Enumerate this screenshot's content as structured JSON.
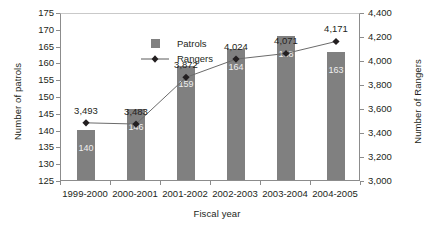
{
  "chart_data": {
    "type": "bar",
    "title": "",
    "xlabel": "Fiscal year",
    "ylabel": "Number of patrols",
    "ylabel_secondary": "Number of Rangers",
    "categories": [
      "1999-2000",
      "2000-2001",
      "2001-2002",
      "2002-2003",
      "2003-2004",
      "2004-2005"
    ],
    "ylim": [
      125,
      175
    ],
    "ylim_secondary": [
      3000,
      4400
    ],
    "yticks": [
      125,
      130,
      135,
      140,
      145,
      150,
      155,
      160,
      165,
      170,
      175
    ],
    "ytick_labels": [
      "125",
      "130",
      "135",
      "140",
      "145",
      "150",
      "155",
      "160",
      "165",
      "170",
      "175"
    ],
    "yticks_secondary": [
      3000,
      3200,
      3400,
      3600,
      3800,
      4000,
      4200,
      4400
    ],
    "ytick_labels_secondary": [
      "3,000",
      "3,200",
      "3,400",
      "3,600",
      "3,800",
      "4,000",
      "4,200",
      "4,400"
    ],
    "grid": false,
    "legend_position": "upper-left-inside",
    "series": [
      {
        "name": "Patrols",
        "type": "bar",
        "axis": "left",
        "color": "#808080",
        "values": [
          140,
          146,
          159,
          164,
          168,
          163
        ],
        "value_labels": [
          "140",
          "146",
          "159",
          "164",
          "168",
          "163"
        ]
      },
      {
        "name": "Rangers",
        "type": "line",
        "axis": "right",
        "color": "#231f20",
        "marker": "diamond",
        "values": [
          3493,
          3483,
          3872,
          4024,
          4071,
          4171
        ],
        "value_labels": [
          "3,493",
          "3,483",
          "3,872",
          "4,024",
          "4,071",
          "4,171"
        ]
      }
    ]
  },
  "legend": {
    "items": [
      {
        "label": "Patrols",
        "key": "square-swatch"
      },
      {
        "label": "Rangers",
        "key": "line-diamond-marker"
      }
    ]
  }
}
